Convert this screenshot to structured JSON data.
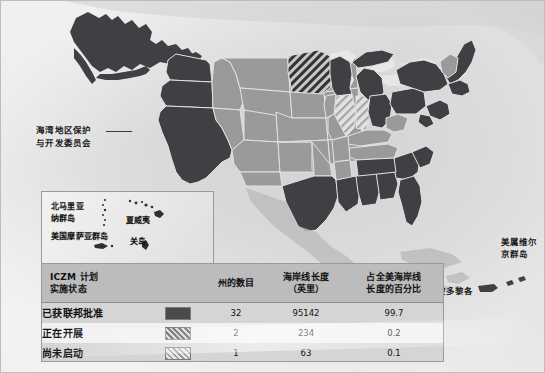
{
  "figure": {
    "type": "choropleth-map-with-table",
    "region": "United States and territories"
  },
  "map": {
    "callout": {
      "line1": "海湾地区保护",
      "line2": "与开发委员会",
      "leader_icon": "leader-line"
    },
    "territory_labels": {
      "virgin_islands_line1": "美属维尔",
      "virgin_islands_line2": "京群岛",
      "puerto_rico": "波多黎各"
    },
    "inset": {
      "northern_mariana_line1": "北马里亚",
      "northern_mariana_line2": "纳群岛",
      "american_samoa": "美国摩萨亚群岛",
      "hawaii": "夏威夷",
      "guam": "关岛"
    },
    "colors": {
      "approved_fill": "#3f3f44",
      "underway_fill_base": "#9a9a9a",
      "not_started_fill": "#c9c9c9",
      "non_participating_fill": "#9a9a9a",
      "state_border": "#e2e2e2",
      "ocean": "#dcdcdc"
    }
  },
  "table": {
    "headers": {
      "status_line1": "ICZM 计划",
      "status_line2": "实施状态",
      "swatch": "",
      "states_count": "州的数目",
      "coastline_line1": "海岸线长度",
      "coastline_line2": "（英里）",
      "percent_line1": "占全美海岸线",
      "percent_line2": "长度的百分比"
    },
    "rows": [
      {
        "label": "已获联邦批准",
        "swatch": "solid-dark-swatch",
        "states": "32",
        "coastline": "95142",
        "percent": "99.7"
      },
      {
        "label": "正在开展",
        "swatch": "dark-hatch-swatch",
        "states": "2",
        "coastline": "234",
        "percent": "0.2"
      },
      {
        "label": "尚未启动",
        "swatch": "light-hatch-swatch",
        "states": "1",
        "coastline": "63",
        "percent": "0.1"
      }
    ]
  }
}
